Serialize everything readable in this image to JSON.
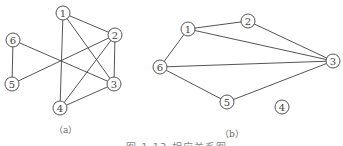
{
  "graphs": [
    {
      "id": "a",
      "label": "（a）",
      "label_pos": [
        54,
        123
      ],
      "nodes": [
        {
          "id": "1",
          "x": 63,
          "y": 13
        },
        {
          "id": "2",
          "x": 115,
          "y": 35
        },
        {
          "id": "3",
          "x": 114,
          "y": 84
        },
        {
          "id": "4",
          "x": 60,
          "y": 108
        },
        {
          "id": "5",
          "x": 12,
          "y": 84
        },
        {
          "id": "6",
          "x": 13,
          "y": 40
        }
      ],
      "edges": [
        [
          "1",
          "2"
        ],
        [
          "1",
          "3"
        ],
        [
          "1",
          "4"
        ],
        [
          "2",
          "3"
        ],
        [
          "2",
          "4"
        ],
        [
          "2",
          "5"
        ],
        [
          "6",
          "3"
        ],
        [
          "6",
          "5"
        ],
        [
          "4",
          "3"
        ]
      ]
    },
    {
      "id": "b",
      "label": "（b）",
      "label_pos": [
        220,
        127
      ],
      "nodes": [
        {
          "id": "1",
          "x": 188,
          "y": 29
        },
        {
          "id": "2",
          "x": 248,
          "y": 21
        },
        {
          "id": "3",
          "x": 333,
          "y": 61
        },
        {
          "id": "4",
          "x": 282,
          "y": 107
        },
        {
          "id": "5",
          "x": 227,
          "y": 102
        },
        {
          "id": "6",
          "x": 160,
          "y": 67
        }
      ],
      "edges": [
        [
          "6",
          "1"
        ],
        [
          "1",
          "2"
        ],
        [
          "1",
          "3"
        ],
        [
          "2",
          "3"
        ],
        [
          "6",
          "3"
        ],
        [
          "6",
          "5"
        ],
        [
          "5",
          "3"
        ]
      ]
    }
  ],
  "node_radius": 7,
  "colors": {
    "stroke": "#555555",
    "text": "#444444",
    "caption": "#888888"
  },
  "caption": "图 1.13  相应关系图"
}
